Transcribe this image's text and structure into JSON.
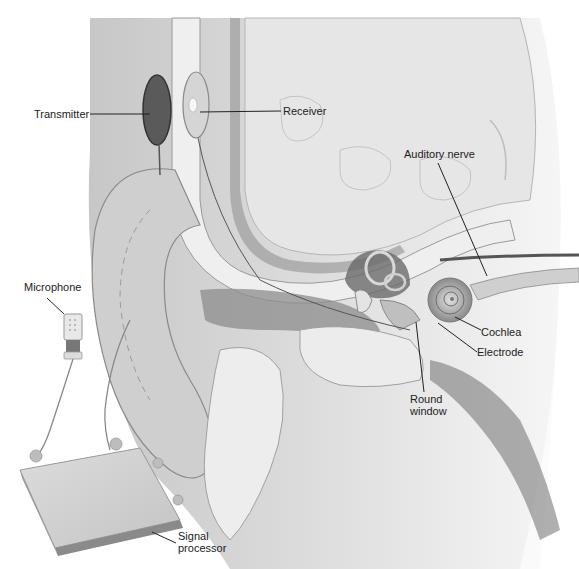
{
  "diagram": {
    "labels": {
      "transmitter": "Transmitter",
      "receiver": "Receiver",
      "auditory_nerve": "Auditory nerve",
      "microphone": "Microphone",
      "cochlea": "Cochlea",
      "electrode": "Electrode",
      "round_window_line1": "Round",
      "round_window_line2": "window",
      "signal_processor_line1": "Signal",
      "signal_processor_line2": "processor"
    },
    "colors": {
      "background": "#ffffff",
      "skin": "#d6d6d6",
      "skin_dark": "#a8a8a8",
      "bone": "#ececec",
      "brain": "#e4e4e4",
      "dark_tissue": "#555555",
      "leader_line": "#222222"
    }
  }
}
